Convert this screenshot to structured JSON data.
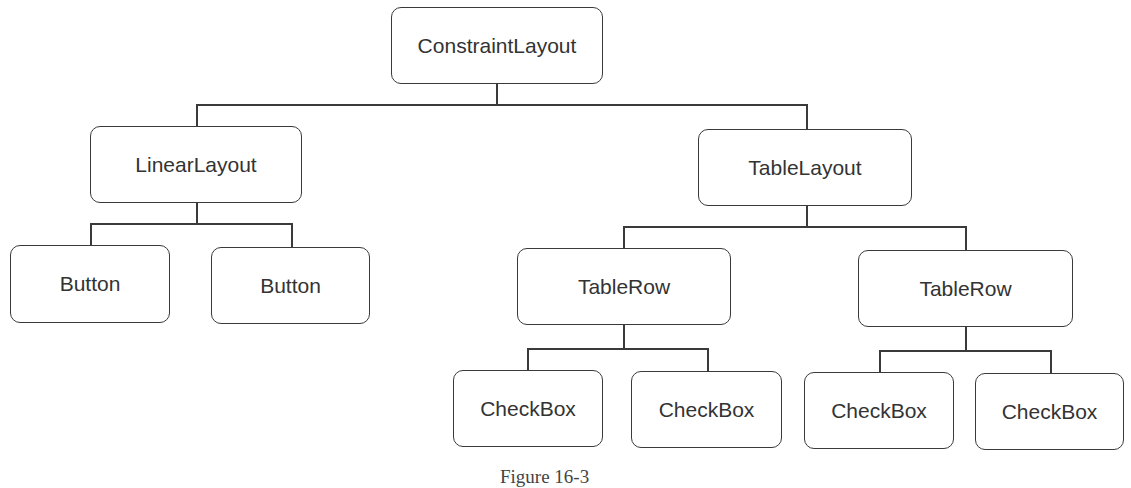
{
  "diagram": {
    "type": "tree",
    "root": {
      "label": "ConstraintLayout",
      "children": [
        {
          "label": "LinearLayout",
          "children": [
            {
              "label": "Button"
            },
            {
              "label": "Button"
            }
          ]
        },
        {
          "label": "TableLayout",
          "children": [
            {
              "label": "TableRow",
              "children": [
                {
                  "label": "CheckBox"
                },
                {
                  "label": "CheckBox"
                }
              ]
            },
            {
              "label": "TableRow",
              "children": [
                {
                  "label": "CheckBox"
                },
                {
                  "label": "CheckBox"
                }
              ]
            }
          ]
        }
      ]
    }
  },
  "nodes": {
    "constraint_layout": "ConstraintLayout",
    "linear_layout": "LinearLayout",
    "button_1": "Button",
    "button_2": "Button",
    "table_layout": "TableLayout",
    "table_row_1": "TableRow",
    "table_row_2": "TableRow",
    "checkbox_1": "CheckBox",
    "checkbox_2": "CheckBox",
    "checkbox_3": "CheckBox",
    "checkbox_4": "CheckBox"
  },
  "caption": "Figure 16-3"
}
